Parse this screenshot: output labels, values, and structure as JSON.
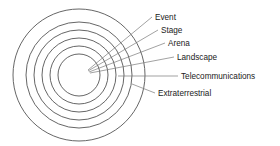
{
  "diagram": {
    "type": "concentric-rings",
    "colors": {
      "ring_stroke": "#555555",
      "leader_stroke": "#7a7a7a",
      "text": "#1a1a1a",
      "background": "#ffffff"
    },
    "center": {
      "x": 79,
      "y": 75
    },
    "rings": [
      {
        "index": 0,
        "label": "Event",
        "radius": 21
      },
      {
        "index": 1,
        "label": "Stage",
        "radius": 29
      },
      {
        "index": 2,
        "label": "Arena",
        "radius": 37
      },
      {
        "index": 3,
        "label": "Landscape",
        "radius": 45
      },
      {
        "index": 4,
        "label": "Telecommunications",
        "radius": 53
      },
      {
        "index": 5,
        "label": "Extraterrestrial",
        "radius": 66
      }
    ],
    "labels": [
      {
        "id": "event",
        "text": "Event",
        "x": 155,
        "y": 20,
        "leader": {
          "x1": 88,
          "y1": 70,
          "x2": 152,
          "y2": 17
        }
      },
      {
        "id": "stage",
        "text": "Stage",
        "x": 161,
        "y": 33,
        "leader": {
          "x1": 88,
          "y1": 71,
          "x2": 158,
          "y2": 30
        }
      },
      {
        "id": "arena",
        "text": "Arena",
        "x": 168,
        "y": 46,
        "leader": {
          "x1": 89,
          "y1": 72,
          "x2": 165,
          "y2": 43
        }
      },
      {
        "id": "landscape",
        "text": "Landscape",
        "x": 177,
        "y": 60,
        "leader": {
          "x1": 90,
          "y1": 73,
          "x2": 174,
          "y2": 57
        }
      },
      {
        "id": "telecommunications",
        "text": "Telecommunications",
        "x": 181,
        "y": 79,
        "leader": {
          "x1": 118,
          "y1": 76,
          "x2": 178,
          "y2": 76
        }
      },
      {
        "id": "extraterrestrial",
        "text": "Extraterrestrial",
        "x": 158,
        "y": 96,
        "leader": {
          "x1": 132,
          "y1": 84,
          "x2": 155,
          "y2": 93
        }
      }
    ]
  }
}
